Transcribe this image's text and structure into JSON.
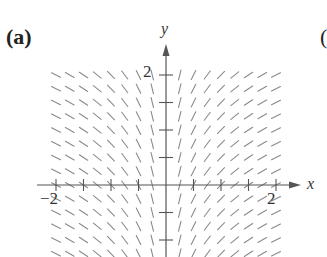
{
  "panel": {
    "label": "(a)",
    "next_panel_partial": "("
  },
  "axes": {
    "x_label": "x",
    "y_label": "y",
    "x_tick_labels": [
      {
        "value": -2,
        "text": "−2"
      },
      {
        "value": 2,
        "text": "2"
      }
    ],
    "y_tick_labels": [
      {
        "value": 2,
        "text": "2"
      }
    ],
    "x_ticks": [
      -2,
      -1.5,
      -1,
      -0.5,
      0.5,
      1,
      1.5,
      2
    ],
    "y_ticks": [
      2,
      1.5,
      1,
      0.5,
      -0.5,
      -1
    ],
    "x_range": [
      -2.3,
      2.5
    ],
    "y_range": [
      -1.3,
      2.5
    ]
  },
  "slope_field": {
    "equation_guess": "dy/dx = 1/x",
    "x_step": 0.25,
    "y_step": 0.25,
    "x_min": -2,
    "x_max": 2,
    "y_min": -1.25,
    "y_max": 2,
    "segment_length_px": 10,
    "color": "#8a8a8a"
  },
  "colors": {
    "axis": "#555555",
    "text": "#333333",
    "background": "#ffffff"
  },
  "layout": {
    "origin_px": [
      166,
      185
    ],
    "unit_px": 55
  }
}
